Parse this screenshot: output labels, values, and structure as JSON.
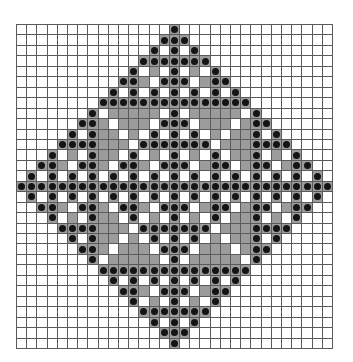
{
  "diagram": {
    "type": "grid-pattern",
    "columns": 31,
    "rows_count": 31,
    "legend": {
      ".": "empty cell",
      "g": "shaded cell",
      "o": "shaded cell with black dot"
    },
    "colors": {
      "grid_line": "#5a5a5a",
      "shaded": "#9c9c9c",
      "dot": "#141414",
      "background": "#ffffff"
    },
    "rows": [
      "...............o...............",
      "..............ooo..............",
      ".............o.o.o.............",
      "............ooooooo............",
      "...........o.g.o.g.o...........",
      "..........oog.ooo.goo..........",
      ".........o.o.o.o.o.o.o.........",
      "........ooooooooooooooo........",
      ".......o.ggggg.o.ggggg.o.......",
      "......oog.ggg.ooo.ggg.goo......",
      ".....o.ogg.g.o.o.o.g.ggo.o.....",
      "....ooooggg.ooooooo.gggoooo....",
      "...o.g.ogg.o.g.o.g.o.ggo.g.o...",
      "..oog.oog.oog.ooo.goo.goo.goo..",
      ".o.o.o.o.o.o.o.o.o.o.o.o.o.o.o.",
      "ooooooooooooooooooooooooooooooo",
      ".o.o.o.o.o.o.o.o.o.o.o.o.o.o.o.",
      "..oog.oog.oog.ooo.goo.goo.goo..",
      "...o.g.ogg.o.g.o.g.o.ggo.g.o...",
      "....ooooggg.ooooooo.gggoooo....",
      ".....o.ogg.g.o.o.o.g.ggo.o.....",
      "......oog.ggg.ooo.ggg.goo......",
      ".......o.ggggg.o.ggggg.o.......",
      "........ooooooooooooooo........",
      ".........o.o.o.o.o.o.o.........",
      "..........oog.ooo.goo..........",
      "...........o.g.o.g.o...........",
      "............ooooooo............",
      ".............o.o.o.............",
      "..............ooo..............",
      "...............o..............."
    ]
  }
}
